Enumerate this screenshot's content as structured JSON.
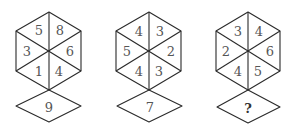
{
  "puzzle": {
    "figures": [
      {
        "label": "figure-1",
        "hexagon": {
          "top_left": "5",
          "top_right": "8",
          "left": "3",
          "right": "6",
          "bottom_left": "1",
          "bottom_right": "4"
        },
        "diamond": "9"
      },
      {
        "label": "figure-2",
        "hexagon": {
          "top_left": "4",
          "top_right": "3",
          "left": "5",
          "right": "2",
          "bottom_left": "4",
          "bottom_right": "3"
        },
        "diamond": "7"
      },
      {
        "label": "figure-3",
        "hexagon": {
          "top_left": "3",
          "top_right": "4",
          "left": "2",
          "right": "6",
          "bottom_left": "4",
          "bottom_right": "5"
        },
        "diamond": "?"
      }
    ]
  }
}
